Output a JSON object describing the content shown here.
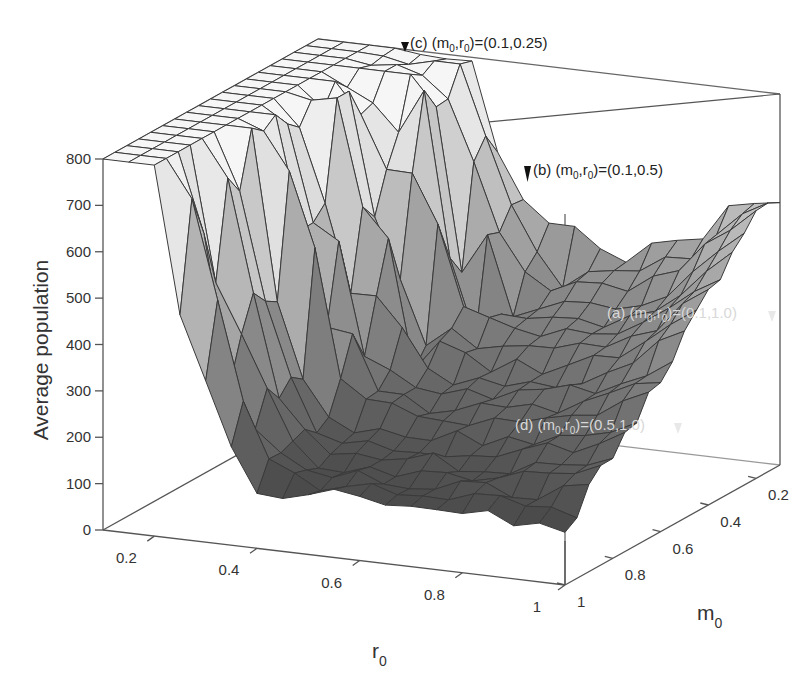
{
  "chart_data": {
    "type": "surface3d",
    "title": "",
    "xlabel": "r",
    "xlabel_subscript": "0",
    "ylabel": "m",
    "ylabel_subscript": "0",
    "zlabel": "Average population",
    "x_ticks": [
      "0.2",
      "0.4",
      "0.6",
      "0.8",
      "1"
    ],
    "y_ticks": [
      "0.2",
      "0.4",
      "0.6",
      "0.8",
      "1"
    ],
    "z_ticks": [
      "0",
      "100",
      "200",
      "300",
      "400",
      "500",
      "600",
      "700",
      "800"
    ],
    "xlim": [
      0.1,
      1.0
    ],
    "ylim": [
      0.1,
      1.0
    ],
    "zlim": [
      0,
      800
    ],
    "grid": false,
    "box": true,
    "r0_values": [
      0.1,
      0.15,
      0.2,
      0.25,
      0.3,
      0.35,
      0.4,
      0.45,
      0.5,
      0.55,
      0.6,
      0.65,
      0.7,
      0.75,
      0.8,
      0.85,
      0.9,
      0.95,
      1.0
    ],
    "m0_values": [
      0.1,
      0.15,
      0.2,
      0.25,
      0.3,
      0.35,
      0.4,
      0.45,
      0.5,
      0.55,
      0.6,
      0.65,
      0.7,
      0.75,
      0.8,
      0.85,
      0.9,
      0.95,
      1.0
    ],
    "surface_description": "Plateau at ~800 for small r0 (<=0.25) across all m0; sharp drop for r0 between ~0.25 and ~0.5 depending on m0; basin of ~100-250 at mid-to-large r0 and large m0; rises toward ~450-600 at r0=1 for small m0.",
    "annotations": [
      {
        "label": "(a)",
        "m0": 0.1,
        "r0": 1.0,
        "z": 430,
        "text": "(a) (m0,r0)=(0.1,1.0)"
      },
      {
        "label": "(b)",
        "m0": 0.1,
        "r0": 0.5,
        "z": 640,
        "text": "(b) (m0,r0)=(0.1,0.5)"
      },
      {
        "label": "(c)",
        "m0": 0.1,
        "r0": 0.25,
        "z": 800,
        "text": "(c) (m0,r0)=(0.1,0.25)"
      },
      {
        "label": "(d)",
        "m0": 0.5,
        "r0": 1.0,
        "z": 200,
        "text": "(d) (m0,r0)=(0.5,1.0)"
      }
    ]
  },
  "axes": {
    "z_label": "Average population",
    "r_label": "r",
    "r_sub": "0",
    "m_label": "m",
    "m_sub": "0"
  },
  "annotation_labels": {
    "a": {
      "prefix": "(a) (m",
      "mid": ",r",
      "suffix": ")=(0.1,1.0)"
    },
    "b": {
      "prefix": "(b) (m",
      "mid": ",r",
      "suffix": ")=(0.1,0.5)"
    },
    "c": {
      "prefix": "(c) (m",
      "mid": ",r",
      "suffix": ")=(0.1,0.25)"
    },
    "d": {
      "prefix": "(d) (m",
      "mid": ",r",
      "suffix": ")=(0.5,1.0)"
    },
    "sub": "0"
  },
  "colors": {
    "background": "#ffffff",
    "axis": "#555555",
    "mesh_line": "#3a3a3a",
    "surface_high": "#f4f4f4",
    "surface_low": "#4a4a4a"
  }
}
